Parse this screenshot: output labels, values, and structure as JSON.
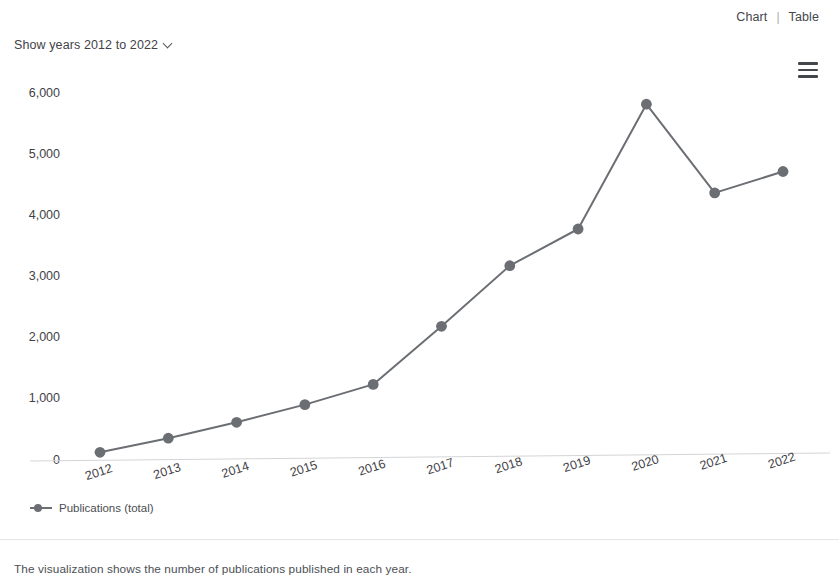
{
  "view_switch": {
    "chart_label": "Chart",
    "separator": "|",
    "table_label": "Table"
  },
  "menu": {
    "icon": "hamburger-menu-icon"
  },
  "year_selector": {
    "label": "Show years 2012 to 2022",
    "chevron_icon": "chevron-down-icon"
  },
  "legend": {
    "entries": [
      {
        "label": "Publications (total)",
        "color": "#6b6f74",
        "marker": "circle"
      }
    ]
  },
  "footer": {
    "caption": "The visualization shows the number of publications published in each year."
  },
  "colors": {
    "series": "#6b6f74",
    "axis": "#d3d5d8",
    "text": "#3f4247"
  },
  "chart_data": {
    "type": "line",
    "title": "",
    "xlabel": "",
    "ylabel": "",
    "categories": [
      "2012",
      "2013",
      "2014",
      "2015",
      "2016",
      "2017",
      "2018",
      "2019",
      "2020",
      "2021",
      "2022"
    ],
    "series": [
      {
        "name": "Publications (total)",
        "color": "#6b6f74",
        "marker": "circle",
        "values": [
          110,
          340,
          600,
          890,
          1220,
          2170,
          3160,
          3760,
          5800,
          4350,
          4700
        ]
      }
    ],
    "ylim": [
      0,
      6000
    ],
    "yticks": [
      0,
      1000,
      2000,
      3000,
      4000,
      5000,
      6000
    ],
    "ytick_labels": [
      "0",
      "1,000",
      "2,000",
      "3,000",
      "4,000",
      "5,000",
      "6,000"
    ],
    "grid": false,
    "legend_position": "bottom-left",
    "xtick_rotation": -18
  }
}
